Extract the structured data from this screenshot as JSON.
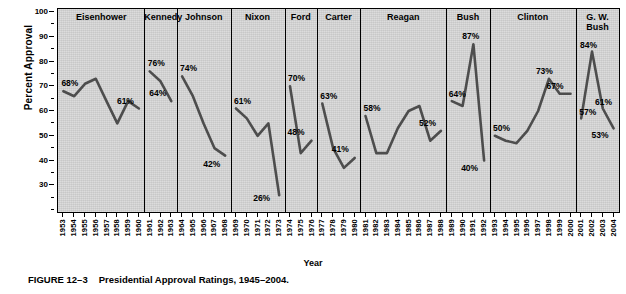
{
  "figure": {
    "number": "FIGURE 12–3",
    "caption": "Presidential Approval Ratings, 1945–2004."
  },
  "axes": {
    "ylabel": "Percent Approval",
    "xlabel": "Year",
    "yticks": [
      100,
      90,
      80,
      70,
      60,
      50,
      40,
      30
    ],
    "ylim": [
      20,
      100
    ],
    "xlim": [
      1953,
      2004
    ]
  },
  "chart_data": {
    "type": "line",
    "title": "Presidential Approval Ratings, 1945–2004.",
    "xlabel": "Year",
    "ylabel": "Percent Approval",
    "ylim": [
      20,
      100
    ],
    "yticks": [
      100,
      90,
      80,
      70,
      60,
      50,
      40,
      30
    ],
    "grid": false,
    "legend": "none",
    "line_color": "#4d4d4d",
    "panel_background": "#d5d5d5",
    "panels": [
      {
        "name": "Eisenhower",
        "years": [
          1953,
          1954,
          1955,
          1956,
          1957,
          1958,
          1959,
          1960
        ],
        "values": [
          68,
          66,
          71,
          73,
          64,
          55,
          64,
          61
        ],
        "labels": [
          {
            "year": 1953,
            "value": 68,
            "text": "68%"
          },
          {
            "year": 1960,
            "value": 61,
            "text": "61%"
          }
        ]
      },
      {
        "name": "Kennedy",
        "years": [
          1961,
          1962,
          1963
        ],
        "values": [
          76,
          72,
          64
        ],
        "labels": [
          {
            "year": 1961,
            "value": 76,
            "text": "76%"
          },
          {
            "year": 1963,
            "value": 64,
            "text": "64%"
          }
        ]
      },
      {
        "name": "Johnson",
        "years": [
          1964,
          1965,
          1966,
          1967,
          1968
        ],
        "values": [
          74,
          66,
          55,
          45,
          42
        ],
        "labels": [
          {
            "year": 1964,
            "value": 74,
            "text": "74%"
          },
          {
            "year": 1968,
            "value": 42,
            "text": "42%"
          }
        ]
      },
      {
        "name": "Nixon",
        "years": [
          1969,
          1970,
          1971,
          1972,
          1973
        ],
        "values": [
          61,
          57,
          50,
          55,
          26
        ],
        "labels": [
          {
            "year": 1969,
            "value": 61,
            "text": "61%"
          },
          {
            "year": 1973,
            "value": 26,
            "text": "26%"
          }
        ]
      },
      {
        "name": "Ford",
        "years": [
          1974,
          1975,
          1976
        ],
        "values": [
          70,
          43,
          48
        ],
        "labels": [
          {
            "year": 1974,
            "value": 70,
            "text": "70%"
          },
          {
            "year": 1976,
            "value": 48,
            "text": "48%"
          }
        ]
      },
      {
        "name": "Carter",
        "years": [
          1977,
          1978,
          1979,
          1980
        ],
        "values": [
          63,
          45,
          37,
          41
        ],
        "labels": [
          {
            "year": 1977,
            "value": 63,
            "text": "63%"
          },
          {
            "year": 1980,
            "value": 41,
            "text": "41%"
          }
        ]
      },
      {
        "name": "Reagan",
        "years": [
          1981,
          1982,
          1983,
          1984,
          1985,
          1986,
          1987,
          1988
        ],
        "values": [
          58,
          43,
          43,
          53,
          60,
          62,
          48,
          52
        ],
        "labels": [
          {
            "year": 1981,
            "value": 58,
            "text": "58%"
          },
          {
            "year": 1988,
            "value": 52,
            "text": "52%"
          }
        ]
      },
      {
        "name": "Bush",
        "years": [
          1989,
          1990,
          1991,
          1992
        ],
        "values": [
          64,
          62,
          87,
          40
        ],
        "labels": [
          {
            "year": 1989,
            "value": 64,
            "text": "64%"
          },
          {
            "year": 1991,
            "value": 87,
            "text": "87%"
          },
          {
            "year": 1992,
            "value": 40,
            "text": "40%"
          }
        ]
      },
      {
        "name": "Clinton",
        "years": [
          1993,
          1994,
          1995,
          1996,
          1997,
          1998,
          1999,
          2000
        ],
        "values": [
          50,
          48,
          47,
          52,
          60,
          73,
          67,
          67
        ],
        "labels": [
          {
            "year": 1993,
            "value": 50,
            "text": "50%"
          },
          {
            "year": 1998,
            "value": 73,
            "text": "73%"
          },
          {
            "year": 2000,
            "value": 67,
            "text": "67%"
          }
        ]
      },
      {
        "name": "G. W. Bush",
        "years": [
          2001,
          2002,
          2003,
          2004
        ],
        "values": [
          57,
          84,
          61,
          53
        ],
        "labels": [
          {
            "year": 2001,
            "value": 57,
            "text": "57%"
          },
          {
            "year": 2002,
            "value": 84,
            "text": "84%"
          },
          {
            "year": 2003,
            "value": 61,
            "text": "61%"
          },
          {
            "year": 2004,
            "value": 53,
            "text": "53%"
          }
        ]
      }
    ]
  }
}
